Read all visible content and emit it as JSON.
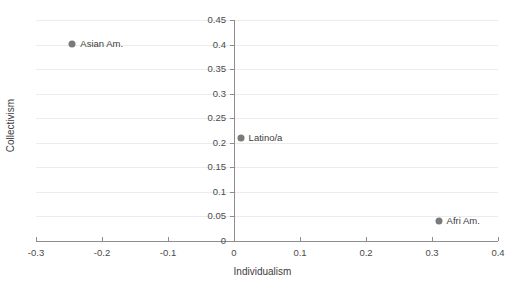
{
  "chart_data": {
    "type": "scatter",
    "title": "",
    "xlabel": "Individualism",
    "ylabel": "Collectivism",
    "xlim": [
      -0.3,
      0.4
    ],
    "ylim": [
      0,
      0.45
    ],
    "xticks": [
      -0.3,
      -0.2,
      -0.1,
      0,
      0.1,
      0.2,
      0.3,
      0.4
    ],
    "xticklabels": [
      "-0.3",
      "-0.2",
      "-0.1",
      "0",
      "0.1",
      "0.2",
      "0.3",
      "0.4"
    ],
    "yticks": [
      0,
      0.05,
      0.1,
      0.15,
      0.2,
      0.25,
      0.3,
      0.35,
      0.4,
      0.45
    ],
    "yticklabels": [
      "0",
      "0.05",
      "0.1",
      "0.15",
      "0.2",
      "0.25",
      "0.3",
      "0.35",
      "0.4",
      "0.45"
    ],
    "grid": "horizontal",
    "legend": "none",
    "marker_color": "#7a7a7a",
    "grid_color": "#ececec",
    "axis_color": "#8d8d8d",
    "points": [
      {
        "label": "Asian Am.",
        "x": -0.245,
        "y": 0.402
      },
      {
        "label": "Latino/a",
        "x": 0.01,
        "y": 0.21
      },
      {
        "label": "Afri Am.",
        "x": 0.31,
        "y": 0.041
      }
    ]
  }
}
